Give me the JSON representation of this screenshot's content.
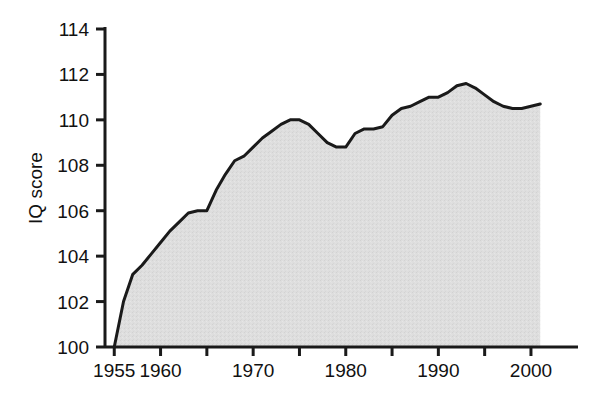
{
  "chart_data": {
    "type": "area",
    "title": "",
    "subtitle": "",
    "xlabel": "",
    "ylabel": "IQ score",
    "xlim": [
      1954.0,
      2002.0
    ],
    "ylim": [
      100,
      114
    ],
    "grid": false,
    "legend": null,
    "fill_color": "#dcdcdc",
    "line_color": "#1a1a1a",
    "axis_color": "#1a1a1a",
    "x_tick_values": [
      1955,
      1960,
      1965,
      1970,
      1975,
      1980,
      1985,
      1990,
      1995,
      2000
    ],
    "x_tick_labels": [
      "1955",
      "1960",
      "",
      "1970",
      "",
      "1980",
      "",
      "1990",
      "",
      "2000"
    ],
    "x_labeled_ticks": [
      {
        "value": 1955,
        "label": "1955"
      },
      {
        "value": 1960,
        "label": "1960"
      },
      {
        "value": 1970,
        "label": "1970"
      },
      {
        "value": 1980,
        "label": "1980"
      },
      {
        "value": 1990,
        "label": "1990"
      },
      {
        "value": 2000,
        "label": "2000"
      }
    ],
    "y_tick_values": [
      100,
      102,
      104,
      106,
      108,
      110,
      112,
      114
    ],
    "y_tick_labels": [
      "100",
      "102",
      "104",
      "106",
      "108",
      "110",
      "112",
      "114"
    ],
    "x": [
      1955,
      1956,
      1957,
      1958,
      1959,
      1960,
      1961,
      1962,
      1963,
      1964,
      1965,
      1966,
      1967,
      1968,
      1969,
      1970,
      1971,
      1972,
      1973,
      1974,
      1975,
      1976,
      1977,
      1978,
      1979,
      1980,
      1981,
      1982,
      1983,
      1984,
      1985,
      1986,
      1987,
      1988,
      1989,
      1990,
      1991,
      1992,
      1993,
      1994,
      1995,
      1996,
      1997,
      1998,
      1999,
      2000,
      2001
    ],
    "values": [
      100.0,
      102.0,
      103.2,
      103.6,
      104.1,
      104.6,
      105.1,
      105.5,
      105.9,
      106.0,
      106.0,
      106.9,
      107.6,
      108.2,
      108.4,
      108.8,
      109.2,
      109.5,
      109.8,
      110.0,
      110.0,
      109.8,
      109.4,
      109.0,
      108.8,
      108.8,
      109.4,
      109.6,
      109.6,
      109.7,
      110.2,
      110.5,
      110.6,
      110.8,
      111.0,
      111.0,
      111.2,
      111.5,
      111.6,
      111.4,
      111.1,
      110.8,
      110.6,
      110.5,
      110.5,
      110.6,
      110.7
    ],
    "series": [
      {
        "name": "IQ score",
        "values": [
          100.0,
          102.0,
          103.2,
          103.6,
          104.1,
          104.6,
          105.1,
          105.5,
          105.9,
          106.0,
          106.0,
          106.9,
          107.6,
          108.2,
          108.4,
          108.8,
          109.2,
          109.5,
          109.8,
          110.0,
          110.0,
          109.8,
          109.4,
          109.0,
          108.8,
          108.8,
          109.4,
          109.6,
          109.6,
          109.7,
          110.2,
          110.5,
          110.6,
          110.8,
          111.0,
          111.0,
          111.2,
          111.5,
          111.6,
          111.4,
          111.1,
          110.8,
          110.6,
          110.5,
          110.5,
          110.6,
          110.7
        ]
      }
    ],
    "annotations": []
  }
}
